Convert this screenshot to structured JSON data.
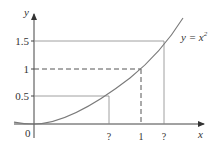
{
  "figure": {
    "curve_label": "y = x²",
    "curve_label_base": "y = x",
    "curve_label_exp": "2",
    "axes": {
      "x_label": "x",
      "y_label": "y",
      "origin_label": "0"
    },
    "y_ticks": [
      "0.5",
      "1",
      "1.5"
    ],
    "x_ticks": [
      "?",
      "1",
      "?"
    ],
    "colors": {
      "curve": "#7a7a7a",
      "axis": "#333333",
      "guide": "#555555"
    }
  }
}
